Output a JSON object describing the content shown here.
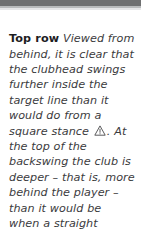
{
  "page": {
    "background_color": "#ffffff",
    "text_color": "#3b3b3d",
    "lead_color": "#1d1d1f"
  },
  "top_bar": {
    "name": "page-top-rule",
    "color": "#6f7071",
    "shade_color": "#b9bbbc",
    "shade2_color": "#e6e7e8"
  },
  "caption": {
    "lead_label": "Top row",
    "text_before_icon": " Viewed from behind, it is clear that the clubhead swings further inside the target line than it would do from a square stance ",
    "icon": {
      "name": "warning-triangle-icon",
      "glyph": "!",
      "color": "#4a4a4c"
    },
    "text_after_icon": ". At the top of the backswing the club is deeper – that is, more behind the player – than it would be when a straight",
    "full_text": "Top row Viewed from behind, it is clear that the clubhead swings further inside the target line than it would do from a square stance ⚠ . At the top of the backswing the club is deeper – that is, more behind the player – than it would be when a straight"
  }
}
